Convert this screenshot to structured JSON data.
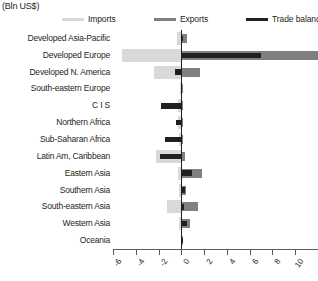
{
  "header": {
    "unit_label": "(Bln US$)"
  },
  "legend": {
    "items": [
      {
        "label": "Imports",
        "color": "#d9d9d9",
        "key": "imports"
      },
      {
        "label": "Exports",
        "color": "#7f7f7f",
        "key": "exports"
      },
      {
        "label": "Trade balance",
        "color": "#231f20",
        "key": "balance"
      }
    ]
  },
  "axis": {
    "ticks": [
      -6,
      -4,
      -2,
      0,
      2,
      4,
      6,
      8,
      10,
      12
    ],
    "tick_labels": [
      "-6",
      "-4",
      "-2",
      "0",
      "2",
      "4",
      "6",
      "8",
      "10",
      "12"
    ],
    "min": -6,
    "max": 12
  },
  "chart_data": {
    "type": "bar",
    "orientation": "horizontal",
    "title": "",
    "subtitle": "",
    "xlabel": "(Bln US$)",
    "ylabel": "",
    "xlim": [
      -6,
      12
    ],
    "grid": false,
    "legend_position": "top",
    "categories": [
      "Developed Asia-Pacific",
      "Developed Europe",
      "Developed N. America",
      "South-eastern Europe",
      "C I S",
      "Northern Africa",
      "Sub-Saharan Africa",
      "Latin Am, Caribbean",
      "Eastern Asia",
      "Southern Asia",
      "South-eastern Asia",
      "Western Asia",
      "Oceania"
    ],
    "series": [
      {
        "name": "Imports",
        "color": "#d9d9d9",
        "values": [
          -0.35,
          -5.2,
          -2.4,
          -0.12,
          -0.25,
          -0.25,
          -0.2,
          -2.2,
          -0.25,
          -0.2,
          -1.3,
          -0.2,
          -0.05
        ]
      },
      {
        "name": "Exports",
        "color": "#7f7f7f",
        "values": [
          0.5,
          12.5,
          1.6,
          0.1,
          0.15,
          0.15,
          0.15,
          0.35,
          1.8,
          0.45,
          1.5,
          0.75,
          0.08
        ]
      },
      {
        "name": "Trade balance",
        "color": "#231f20",
        "values": [
          0.15,
          7.0,
          -0.6,
          -0.05,
          -1.75,
          -0.5,
          -1.4,
          -1.9,
          0.9,
          0.3,
          0.25,
          0.5,
          0.03
        ]
      }
    ]
  }
}
